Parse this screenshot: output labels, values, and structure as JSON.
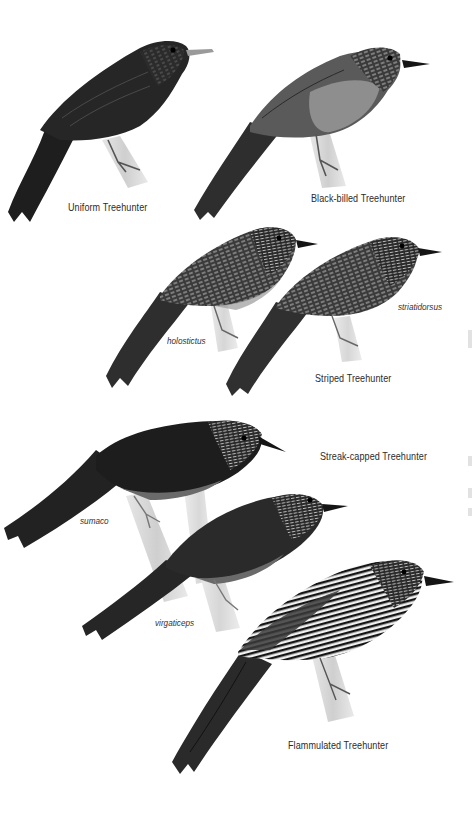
{
  "plate": {
    "background": "#ffffff",
    "species": [
      {
        "id": "uniform",
        "name": "Uniform Treehunter",
        "subspecies": []
      },
      {
        "id": "black-billed",
        "name": "Black-billed Treehunter",
        "subspecies": []
      },
      {
        "id": "striped",
        "name": "Striped Treehunter",
        "subspecies": [
          "holostictus",
          "striatidorsus"
        ]
      },
      {
        "id": "streak-capped",
        "name": "Streak-capped Treehunter",
        "subspecies": [
          "sumaco",
          "virgaticeps"
        ]
      },
      {
        "id": "flammulated",
        "name": "Flammulated Treehunter",
        "subspecies": []
      }
    ]
  },
  "labels": {
    "uniform": "Uniform Treehunter",
    "black_billed": "Black-billed Treehunter",
    "striped": "Striped Treehunter",
    "striped_holostictus": "holostictus",
    "striped_striatidorsus": "striatidorsus",
    "streak_capped": "Streak-capped Treehunter",
    "streak_capped_sumaco": "sumaco",
    "streak_capped_virgaticeps": "virgaticeps",
    "flammulated": "Flammulated Treehunter"
  },
  "colors": {
    "ink_dark": "#1c1c1c",
    "ink_mid": "#3a3a3a",
    "belly_gray": "#8a8a8a",
    "branch": "#d9d9d9",
    "label_text": "#2b2b2b"
  }
}
